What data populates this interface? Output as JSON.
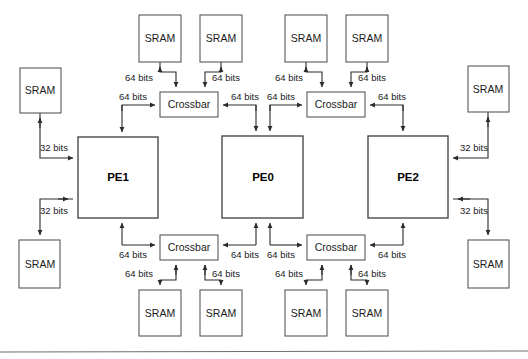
{
  "diagram": {
    "type": "block-diagram",
    "colors": {
      "background": "#ffffff",
      "box_stroke": "#5a5a5a",
      "wire_stroke": "#2b2b2b",
      "text": "#1a1a1a",
      "rule": "#6e6e6e"
    },
    "processing_elements": [
      {
        "id": "pe1",
        "label": "PE1",
        "x": 78,
        "y": 137,
        "w": 80,
        "h": 81
      },
      {
        "id": "pe0",
        "label": "PE0",
        "x": 222,
        "y": 136,
        "w": 81,
        "h": 82
      },
      {
        "id": "pe2",
        "label": "PE2",
        "x": 368,
        "y": 136,
        "w": 80,
        "h": 82
      }
    ],
    "crossbars": [
      {
        "id": "crossbar-top-left",
        "label": "Crossbar",
        "x": 160,
        "y": 92,
        "w": 58,
        "h": 25
      },
      {
        "id": "crossbar-top-right",
        "label": "Crossbar",
        "x": 307,
        "y": 92,
        "w": 58,
        "h": 25
      },
      {
        "id": "crossbar-bottom-left",
        "label": "Crossbar",
        "x": 160,
        "y": 235,
        "w": 58,
        "h": 25
      },
      {
        "id": "crossbar-bottom-right",
        "label": "Crossbar",
        "x": 307,
        "y": 235,
        "w": 58,
        "h": 25
      }
    ],
    "srams": [
      {
        "id": "sram-top-1",
        "label": "SRAM",
        "x": 139,
        "y": 15,
        "w": 42,
        "h": 47
      },
      {
        "id": "sram-top-2",
        "label": "SRAM",
        "x": 200,
        "y": 15,
        "w": 42,
        "h": 47
      },
      {
        "id": "sram-top-3",
        "label": "SRAM",
        "x": 285,
        "y": 15,
        "w": 42,
        "h": 47
      },
      {
        "id": "sram-top-4",
        "label": "SRAM",
        "x": 346,
        "y": 15,
        "w": 42,
        "h": 47
      },
      {
        "id": "sram-left-top",
        "label": "SRAM",
        "x": 20,
        "y": 68,
        "w": 41,
        "h": 45
      },
      {
        "id": "sram-left-bottom",
        "label": "SRAM",
        "x": 19,
        "y": 240,
        "w": 41,
        "h": 48
      },
      {
        "id": "sram-right-top",
        "label": "SRAM",
        "x": 468,
        "y": 66,
        "w": 41,
        "h": 46
      },
      {
        "id": "sram-right-bottom",
        "label": "SRAM",
        "x": 468,
        "y": 240,
        "w": 41,
        "h": 48
      },
      {
        "id": "sram-bottom-1",
        "label": "SRAM",
        "x": 139,
        "y": 290,
        "w": 42,
        "h": 46
      },
      {
        "id": "sram-bottom-2",
        "label": "SRAM",
        "x": 200,
        "y": 290,
        "w": 42,
        "h": 46
      },
      {
        "id": "sram-bottom-3",
        "label": "SRAM",
        "x": 285,
        "y": 290,
        "w": 42,
        "h": 46
      },
      {
        "id": "sram-bottom-4",
        "label": "SRAM",
        "x": 346,
        "y": 290,
        "w": 42,
        "h": 46
      }
    ],
    "bus_labels": [
      {
        "id": "bits-top-1",
        "text": "64 bits",
        "x": 139,
        "y": 78
      },
      {
        "id": "bits-top-2",
        "text": "64 bits",
        "x": 226,
        "y": 78
      },
      {
        "id": "bits-top-3",
        "text": "64 bits",
        "x": 289,
        "y": 78
      },
      {
        "id": "bits-top-4",
        "text": "64 bits",
        "x": 372,
        "y": 78
      },
      {
        "id": "bits-xb-tl-left",
        "text": "64 bits",
        "x": 133,
        "y": 97
      },
      {
        "id": "bits-xb-tl-right",
        "text": "64 bits",
        "x": 245,
        "y": 97
      },
      {
        "id": "bits-xb-tr-left",
        "text": "64 bits",
        "x": 281,
        "y": 97
      },
      {
        "id": "bits-xb-tr-right",
        "text": "64 bits",
        "x": 392,
        "y": 97
      },
      {
        "id": "bits-left-upper",
        "text": "32 bits",
        "x": 54,
        "y": 148
      },
      {
        "id": "bits-left-lower",
        "text": "32 bits",
        "x": 54,
        "y": 211
      },
      {
        "id": "bits-right-upper",
        "text": "32 bits",
        "x": 474,
        "y": 148
      },
      {
        "id": "bits-right-lower",
        "text": "32 bits",
        "x": 474,
        "y": 211
      },
      {
        "id": "bits-xb-bl-left",
        "text": "64 bits",
        "x": 133,
        "y": 255
      },
      {
        "id": "bits-xb-bl-right",
        "text": "64 bits",
        "x": 245,
        "y": 255
      },
      {
        "id": "bits-xb-br-left",
        "text": "64 bits",
        "x": 281,
        "y": 255
      },
      {
        "id": "bits-xb-br-right",
        "text": "64 bits",
        "x": 392,
        "y": 255
      },
      {
        "id": "bits-bottom-1",
        "text": "64 bits",
        "x": 139,
        "y": 274
      },
      {
        "id": "bits-bottom-2",
        "text": "64 bits",
        "x": 226,
        "y": 274
      },
      {
        "id": "bits-bottom-3",
        "text": "64 bits",
        "x": 289,
        "y": 274
      },
      {
        "id": "bits-bottom-4",
        "text": "64 bits",
        "x": 372,
        "y": 274
      }
    ]
  }
}
